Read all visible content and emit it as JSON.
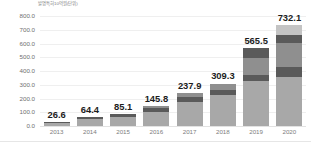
{
  "chart_data": {
    "type": "bar",
    "title": "",
    "subtitle": "",
    "unit_label": "발명특허10억원(단위)",
    "xlabel": "",
    "ylabel": "",
    "categories": [
      "2013",
      "2014",
      "2015",
      "2016",
      "2017",
      "2018",
      "2019",
      "2020"
    ],
    "values": [
      26.6,
      64.4,
      85.1,
      145.8,
      237.9,
      309.3,
      565.5,
      732.1
    ],
    "value_labels": [
      "26.6",
      "64.4",
      "85.1",
      "145.8",
      "237.9",
      "309.3",
      "565.5",
      "732.1"
    ],
    "ylim": [
      0,
      800
    ],
    "yticks": [
      0,
      100,
      200,
      300,
      400,
      500,
      600,
      700,
      800
    ],
    "ytick_labels": [
      "0.0",
      "100.0",
      "200.0",
      "300.0",
      "400.0",
      "500.0",
      "600.0",
      "700.0",
      "800.0"
    ],
    "grid": true,
    "legend": "none",
    "stacked": true,
    "series": [
      {
        "name": "segment-1",
        "values": [
          20.0,
          49.0,
          63.0,
          104.0,
          175.0,
          228.0,
          330.0,
          360.0
        ]
      },
      {
        "name": "segment-2",
        "values": [
          6.6,
          15.4,
          22.1,
          29.0,
          34.0,
          32.0,
          44.0,
          66.0
        ]
      },
      {
        "name": "segment-3",
        "values": [
          0.0,
          0.0,
          0.0,
          12.8,
          28.9,
          49.3,
          120.0,
          175.0
        ]
      },
      {
        "name": "segment-4",
        "values": [
          0.0,
          0.0,
          0.0,
          0.0,
          0.0,
          0.0,
          71.5,
          62.0
        ]
      },
      {
        "name": "segment-5",
        "values": [
          0.0,
          0.0,
          0.0,
          0.0,
          0.0,
          0.0,
          0.0,
          69.1
        ]
      }
    ],
    "colors": {
      "segment_light": "#a8a8a8",
      "segment_dark": "#5a5a5a",
      "segment_mid": "#8f8f8f",
      "segment_pale": "#c4c4c4",
      "gridline": "#efefef",
      "baseline": "#e2e2e2",
      "value_label": "#1c1c1c",
      "tick_label": "#7d7d7d",
      "background": "#ffffff"
    }
  }
}
